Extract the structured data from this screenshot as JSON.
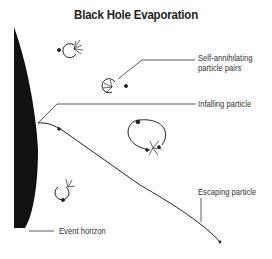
{
  "title": "Black Hole Evaporation",
  "labels": {
    "pairs_line1": "Self-annihilating",
    "pairs_line2": "particle pairs",
    "infalling": "Infalling particle",
    "escaping": "Escaping particle",
    "horizon": "Event horizon"
  },
  "colors": {
    "black_hole": "#111111",
    "line": "#333333",
    "text": "#333333"
  }
}
